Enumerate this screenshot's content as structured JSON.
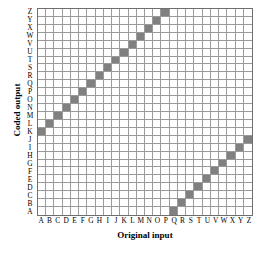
{
  "chart_data": {
    "type": "heatmap",
    "title": "",
    "xlabel": "Original input",
    "ylabel": "Coded output",
    "x_tick_labels": [
      "A",
      "B",
      "C",
      "D",
      "E",
      "F",
      "G",
      "H",
      "I",
      "J",
      "K",
      "L",
      "M",
      "N",
      "O",
      "P",
      "Q",
      "R",
      "S",
      "T",
      "U",
      "V",
      "W",
      "X",
      "Y",
      "Z"
    ],
    "y_tick_labels": [
      "Z",
      "Y",
      "X",
      "W",
      "V",
      "U",
      "T",
      "S",
      "R",
      "Q",
      "P",
      "O",
      "N",
      "M",
      "L",
      "K",
      "J",
      "I",
      "H",
      "G",
      "F",
      "E",
      "D",
      "C",
      "B",
      "A"
    ],
    "x_axis_order": "A to Z, left to right",
    "y_axis_order": "Z at top down to A at bottom",
    "grid": true,
    "legend": "none",
    "cell_fill_color": "#808080",
    "grid_line_color": "#9a9a9a",
    "border_color": "#6f6f6f",
    "background_color": "#ffffff",
    "shift": 10,
    "mapping": [
      {
        "input": "A",
        "output": "K"
      },
      {
        "input": "B",
        "output": "L"
      },
      {
        "input": "C",
        "output": "M"
      },
      {
        "input": "D",
        "output": "N"
      },
      {
        "input": "E",
        "output": "O"
      },
      {
        "input": "F",
        "output": "P"
      },
      {
        "input": "G",
        "output": "Q"
      },
      {
        "input": "H",
        "output": "R"
      },
      {
        "input": "I",
        "output": "S"
      },
      {
        "input": "J",
        "output": "T"
      },
      {
        "input": "K",
        "output": "U"
      },
      {
        "input": "L",
        "output": "V"
      },
      {
        "input": "M",
        "output": "W"
      },
      {
        "input": "N",
        "output": "X"
      },
      {
        "input": "O",
        "output": "Y"
      },
      {
        "input": "P",
        "output": "Z"
      },
      {
        "input": "Q",
        "output": "A"
      },
      {
        "input": "R",
        "output": "B"
      },
      {
        "input": "S",
        "output": "C"
      },
      {
        "input": "T",
        "output": "D"
      },
      {
        "input": "U",
        "output": "E"
      },
      {
        "input": "V",
        "output": "F"
      },
      {
        "input": "W",
        "output": "G"
      },
      {
        "input": "X",
        "output": "H"
      },
      {
        "input": "Y",
        "output": "I"
      },
      {
        "input": "Z",
        "output": "J"
      }
    ]
  }
}
